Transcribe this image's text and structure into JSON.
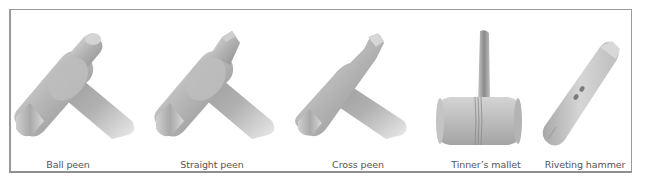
{
  "figure": {
    "border_color": "#9a9a9a",
    "caption_color": "#555555",
    "items": [
      {
        "id": "ball-peen",
        "label": "Ball peen",
        "icon": "ball-peen-hammer-icon"
      },
      {
        "id": "straight-peen",
        "label": "Straight peen",
        "icon": "straight-peen-hammer-icon"
      },
      {
        "id": "cross-peen",
        "label": "Cross peen",
        "icon": "cross-peen-hammer-icon"
      },
      {
        "id": "tinners-mallet",
        "label": "Tinner’s mallet",
        "icon": "tinners-mallet-icon"
      },
      {
        "id": "riveting-hammer",
        "label": "Riveting hammer",
        "icon": "riveting-hammer-icon"
      }
    ]
  }
}
